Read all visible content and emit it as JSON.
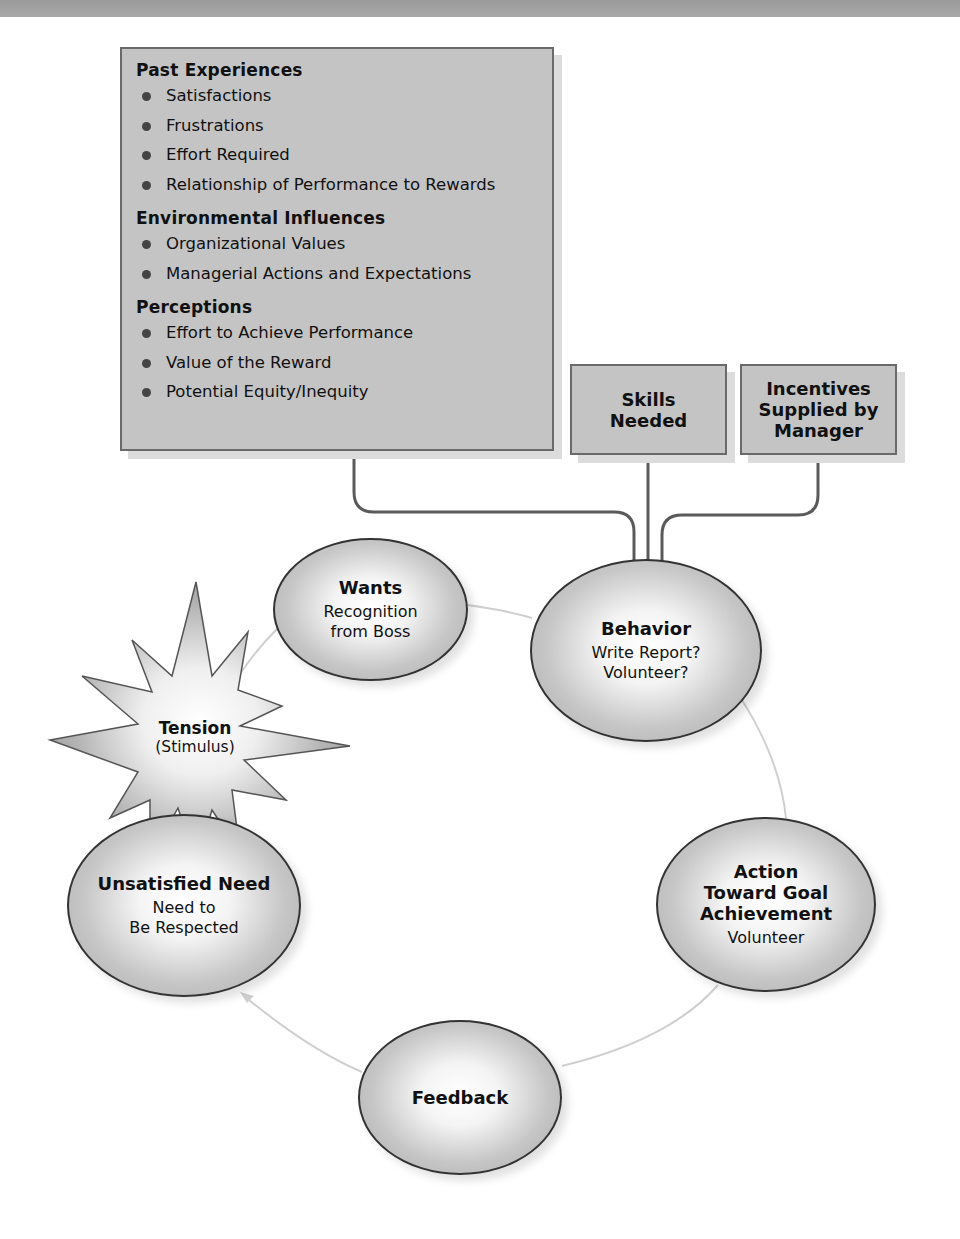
{
  "header_bar": {
    "color": "#9e9e9e"
  },
  "colors": {
    "box_fill": "#c4c4c4",
    "box_border": "#6a6a6a",
    "arrow": "#5a5a5a",
    "cycle_line": "#cfcfcf"
  },
  "influences": {
    "sections": [
      {
        "title": "Past Experiences",
        "items": [
          "Satisfactions",
          "Frustrations",
          "Effort Required",
          "Relationship of Performance to Rewards"
        ]
      },
      {
        "title": "Environmental Influences",
        "items": [
          "Organizational Values",
          "Managerial Actions and Expectations"
        ]
      },
      {
        "title": "Perceptions",
        "items": [
          "Effort to Achieve Performance",
          "Value of the Reward",
          "Potential Equity/Inequity"
        ]
      }
    ]
  },
  "skills_box": {
    "line1": "Skills",
    "line2": "Needed"
  },
  "incentives_box": {
    "line1": "Incentives",
    "line2": "Supplied by",
    "line3": "Manager"
  },
  "cycle": {
    "tension": {
      "title": "Tension",
      "subtitle": "(Stimulus)"
    },
    "wants": {
      "title": "Wants",
      "line1": "Recognition",
      "line2": "from Boss"
    },
    "behavior": {
      "title": "Behavior",
      "line1": "Write Report?",
      "line2": "Volunteer?"
    },
    "action": {
      "title1": "Action",
      "title2": "Toward Goal",
      "title3": "Achievement",
      "line1": "Volunteer"
    },
    "feedback": {
      "title": "Feedback"
    },
    "unsatisfied": {
      "title": "Unsatisfied Need",
      "line1": "Need to",
      "line2": "Be Respected"
    }
  }
}
